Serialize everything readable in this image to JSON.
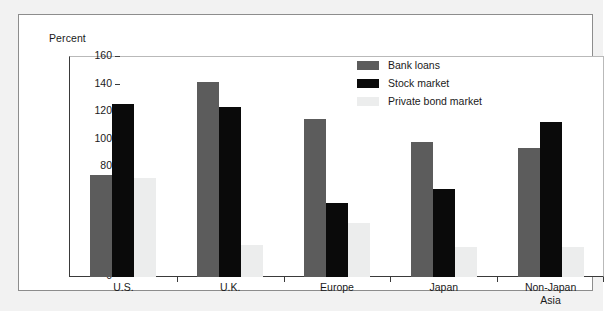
{
  "chart_data": {
    "type": "bar",
    "title": "",
    "subtitle": "",
    "xlabel": "",
    "ylabel": "Percent",
    "ylim": [
      0,
      160
    ],
    "ytick_step": 20,
    "yticks": [
      0,
      20,
      40,
      60,
      80,
      100,
      120,
      140,
      160
    ],
    "grid": false,
    "legend_position": "top-center-right",
    "categories": [
      "U.S.",
      "U.K.",
      "Europe",
      "Japan",
      "Non-Japan\nAsia"
    ],
    "series": [
      {
        "name": "Bank loans",
        "color": "#5c5c5c",
        "values": [
          74,
          142,
          115,
          98,
          94
        ]
      },
      {
        "name": "Stock market",
        "color": "#0a0a0a",
        "values": [
          126,
          124,
          54,
          64,
          113
        ]
      },
      {
        "name": "Private bond market",
        "color": "#eceded",
        "values": [
          72,
          23,
          39,
          22,
          22
        ]
      }
    ]
  },
  "axis": {
    "y_title": "Percent"
  },
  "legend": {
    "items": [
      {
        "label": "Bank loans"
      },
      {
        "label": "Stock market"
      },
      {
        "label": "Private bond market"
      }
    ]
  },
  "colors": {
    "bank_loans": "#5c5c5c",
    "stock_market": "#0a0a0a",
    "private_bond_market": "#eceded",
    "axis": "#3a3a3a",
    "frame": "#b9b9b9",
    "card_border": "#8d8d8d",
    "page_background": "#f2f2f2"
  }
}
